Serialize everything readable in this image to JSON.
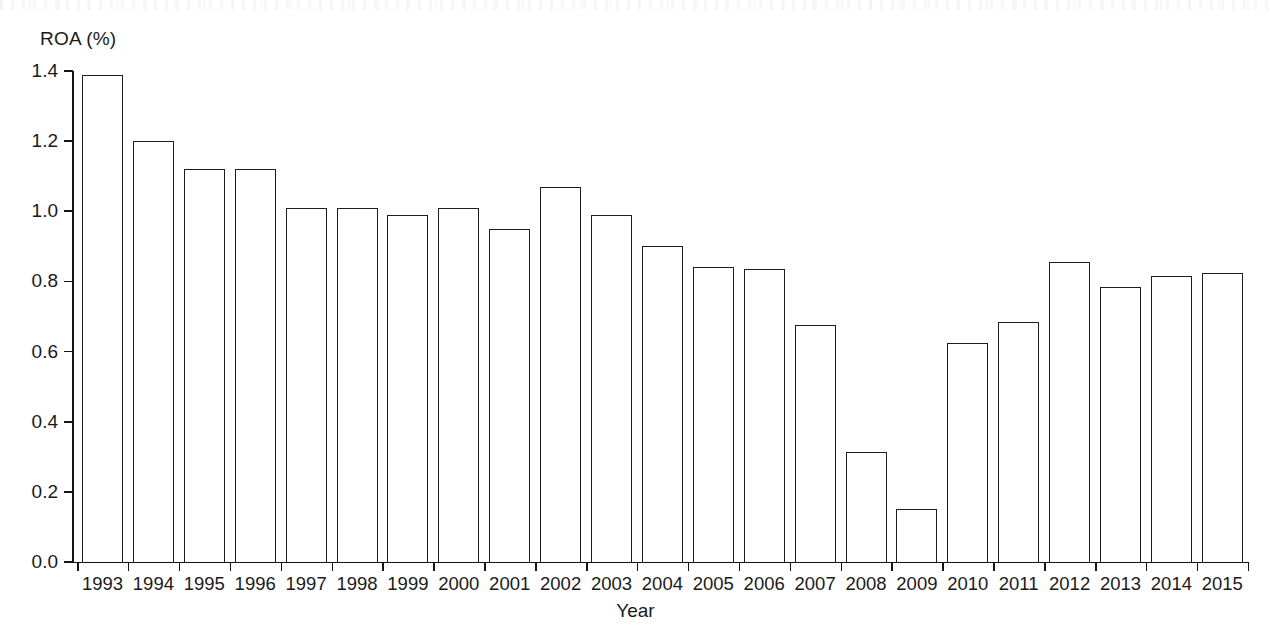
{
  "chart_data": {
    "type": "bar",
    "title": "",
    "xlabel": "Year",
    "ylabel": "ROA (%)",
    "categories": [
      "1993",
      "1994",
      "1995",
      "1996",
      "1997",
      "1998",
      "1999",
      "2000",
      "2001",
      "2002",
      "2003",
      "2004",
      "2005",
      "2006",
      "2007",
      "2008",
      "2009",
      "2010",
      "2011",
      "2012",
      "2013",
      "2014",
      "2015"
    ],
    "values": [
      1.39,
      1.2,
      1.12,
      1.12,
      1.01,
      1.01,
      0.99,
      1.01,
      0.95,
      1.07,
      0.99,
      0.9,
      0.84,
      0.835,
      0.675,
      0.315,
      0.15,
      0.625,
      0.685,
      0.855,
      0.785,
      0.815,
      0.825
    ],
    "ylim": [
      0.0,
      1.4
    ],
    "ytick_labels": [
      "0.0",
      "0.2",
      "0.4",
      "0.6",
      "0.8",
      "1.0",
      "1.2",
      "1.4"
    ],
    "ytick_values": [
      0.0,
      0.2,
      0.4,
      0.6,
      0.8,
      1.0,
      1.2,
      1.4
    ],
    "grid": false,
    "legend": null,
    "series_name": "ROA (%)",
    "bar_fill_color": "#ffffff",
    "bar_edge_color": "#1d1d1d",
    "axis_color": "#141414",
    "background_color": "#ffffff"
  },
  "axes": {
    "y_title": "ROA (%)",
    "x_title": "Year"
  }
}
